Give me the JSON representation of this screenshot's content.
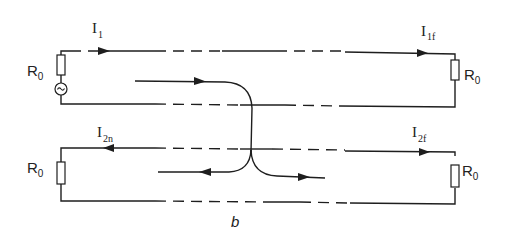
{
  "figure": {
    "panel_label": "b",
    "type": "coupled transmission lines crosstalk schematic"
  },
  "line1": {
    "current_near": {
      "main": "I",
      "sub": "1"
    },
    "current_far": {
      "main": "I",
      "sub": "1f"
    },
    "left_resistor": {
      "main": "R",
      "sub": "0"
    },
    "right_resistor": {
      "main": "R",
      "sub": "0"
    },
    "source_symbol": "~"
  },
  "line2": {
    "current_near": {
      "main": "I",
      "sub": "2n"
    },
    "current_far": {
      "main": "I",
      "sub": "2f"
    },
    "left_resistor": {
      "main": "R",
      "sub": "0"
    },
    "right_resistor": {
      "main": "R",
      "sub": "0"
    }
  },
  "colors": {
    "ink": "#1e1e1e",
    "background": "#ffffff"
  }
}
